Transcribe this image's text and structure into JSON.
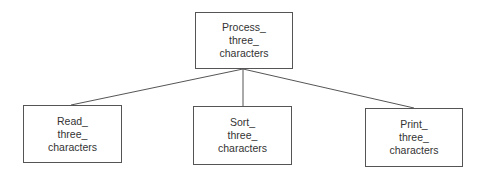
{
  "diagram": {
    "type": "hierarchy-tree",
    "root": {
      "id": "process",
      "lines": [
        "Process_",
        "three_",
        "characters"
      ],
      "box": {
        "x": 195,
        "y": 12,
        "w": 98,
        "h": 57
      }
    },
    "children": [
      {
        "id": "read",
        "lines": [
          "Read_",
          "three_",
          "characters"
        ],
        "box": {
          "x": 23,
          "y": 105,
          "w": 99,
          "h": 58
        }
      },
      {
        "id": "sort",
        "lines": [
          "Sort_",
          "three_",
          "characters"
        ],
        "box": {
          "x": 193,
          "y": 106,
          "w": 99,
          "h": 59
        }
      },
      {
        "id": "print",
        "lines": [
          "Print_",
          "three_",
          "characters"
        ],
        "box": {
          "x": 365,
          "y": 108,
          "w": 98,
          "h": 59
        }
      }
    ],
    "edges": [
      {
        "from": "process",
        "to": "read"
      },
      {
        "from": "process",
        "to": "sort"
      },
      {
        "from": "process",
        "to": "print"
      }
    ],
    "colors": {
      "stroke": "#555555",
      "text": "#333333",
      "background": "#ffffff"
    }
  }
}
